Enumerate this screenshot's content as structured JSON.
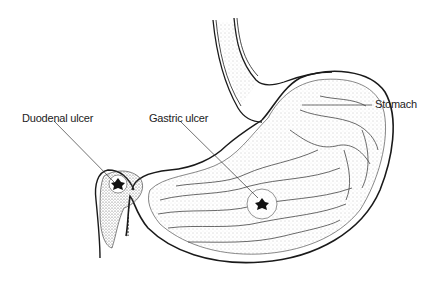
{
  "diagram": {
    "labels": [
      {
        "id": "duodenal",
        "text": "Duodenal ulcer"
      },
      {
        "id": "gastric",
        "text": "Gastric ulcer"
      },
      {
        "id": "stomach",
        "text": "Stomach"
      }
    ],
    "colors": {
      "outline": "#1a1a1a",
      "stipple": "#9a9a9a",
      "ulcer": "#111111",
      "background": "#ffffff"
    }
  }
}
